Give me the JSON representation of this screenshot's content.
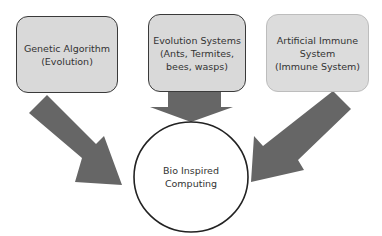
{
  "diagram": {
    "title": "Bio Inspired Computing",
    "nodes": [
      {
        "id": "genetic-algorithm",
        "label": "Genetic Algorithm\n(Evolution)"
      },
      {
        "id": "evolution-systems",
        "label": "Evolution Systems\n(Ants, Termites,\nbees, wasps)"
      },
      {
        "id": "artificial-immune-system",
        "label": "Artificial Immune\nSystem\n(Immune System)"
      }
    ],
    "center": {
      "label": "Bio Inspired\nComputing"
    },
    "edges": [
      {
        "from": "genetic-algorithm",
        "to": "center"
      },
      {
        "from": "evolution-systems",
        "to": "center"
      },
      {
        "from": "artificial-immune-system",
        "to": "center"
      }
    ],
    "colors": {
      "box_fill": "#d9d9d9",
      "arrow": "#666666",
      "border": "#3a3a3a"
    }
  }
}
